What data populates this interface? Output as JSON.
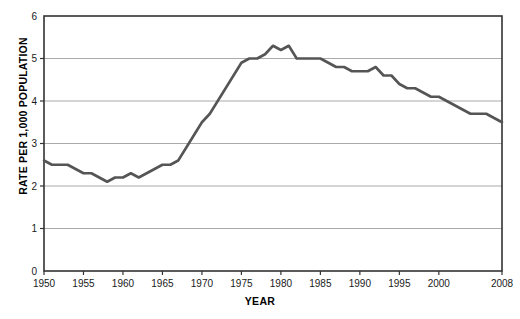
{
  "chart_data": {
    "type": "line",
    "title": "",
    "xlabel": "YEAR",
    "ylabel": "RATE PER 1,000 POPULATION",
    "xlim": [
      1950,
      2008
    ],
    "ylim": [
      0,
      6
    ],
    "yticks": [
      0,
      1,
      2,
      3,
      4,
      5,
      6
    ],
    "xticks": [
      1950,
      1955,
      1960,
      1965,
      1970,
      1975,
      1980,
      1985,
      1990,
      1995,
      2000,
      2008
    ],
    "grid": "horizontal",
    "legend": "none",
    "line_color": "#555555",
    "grid_color": "#aaaaaa",
    "axis_color": "#333333",
    "x": [
      1950,
      1951,
      1952,
      1953,
      1954,
      1955,
      1956,
      1957,
      1958,
      1959,
      1960,
      1961,
      1962,
      1963,
      1964,
      1965,
      1966,
      1967,
      1968,
      1969,
      1970,
      1971,
      1972,
      1973,
      1974,
      1975,
      1976,
      1977,
      1978,
      1979,
      1980,
      1981,
      1982,
      1983,
      1984,
      1985,
      1986,
      1987,
      1988,
      1989,
      1990,
      1991,
      1992,
      1993,
      1994,
      1995,
      1996,
      1997,
      1998,
      1999,
      2000,
      2001,
      2002,
      2003,
      2004,
      2005,
      2006,
      2007,
      2008
    ],
    "values": [
      2.6,
      2.5,
      2.5,
      2.5,
      2.4,
      2.3,
      2.3,
      2.2,
      2.1,
      2.2,
      2.2,
      2.3,
      2.2,
      2.3,
      2.4,
      2.5,
      2.5,
      2.6,
      2.9,
      3.2,
      3.5,
      3.7,
      4.0,
      4.3,
      4.6,
      4.9,
      5.0,
      5.0,
      5.1,
      5.3,
      5.2,
      5.3,
      5.0,
      5.0,
      5.0,
      5.0,
      4.9,
      4.8,
      4.8,
      4.7,
      4.7,
      4.7,
      4.8,
      4.6,
      4.6,
      4.4,
      4.3,
      4.3,
      4.2,
      4.1,
      4.1,
      4.0,
      3.9,
      3.8,
      3.7,
      3.7,
      3.7,
      3.6,
      3.5
    ]
  },
  "axis_labels": {
    "ylabel_text": "RATE PER 1,000 POPULATION",
    "xlabel_text": "YEAR"
  }
}
